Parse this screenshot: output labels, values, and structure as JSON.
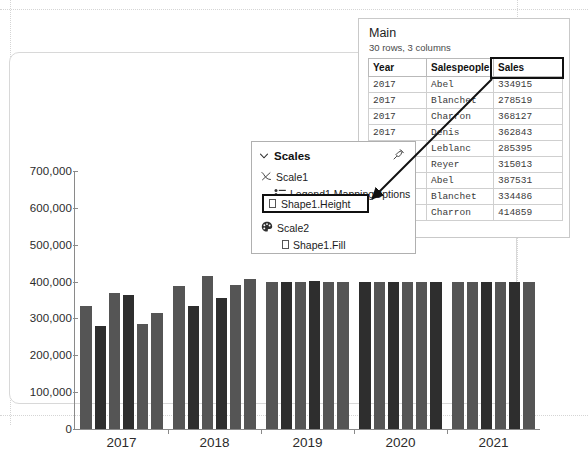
{
  "chart_data": {
    "type": "bar",
    "title": "",
    "xlabel": "",
    "ylabel": "",
    "ylim": [
      0,
      700000
    ],
    "grid": false,
    "legend": "none",
    "y_ticks": [
      "0",
      "100,000",
      "200,000",
      "300,000",
      "400,000",
      "500,000",
      "600,000",
      "700,000"
    ],
    "y_tick_values": [
      0,
      100000,
      200000,
      300000,
      400000,
      500000,
      600000,
      700000
    ],
    "categories": [
      "2017",
      "2018",
      "2019",
      "2020",
      "2021"
    ],
    "bar_color_light": "#555555",
    "bar_color_dark": "#2e2e2e",
    "bars": [
      {
        "year": "2017",
        "salespeople": "Abel",
        "value": 334915,
        "shade": "light"
      },
      {
        "year": "2017",
        "salespeople": "Blanchet",
        "value": 278519,
        "shade": "dark"
      },
      {
        "year": "2017",
        "salespeople": "Charron",
        "value": 368127,
        "shade": "light"
      },
      {
        "year": "2017",
        "salespeople": "Denis",
        "value": 362843,
        "shade": "dark"
      },
      {
        "year": "2017",
        "salespeople": "Leblanc",
        "value": 285395,
        "shade": "light"
      },
      {
        "year": "2017",
        "salespeople": "Reyer",
        "value": 315013,
        "shade": "light"
      },
      {
        "year": "2018",
        "salespeople": "Abel",
        "value": 387531,
        "shade": "light"
      },
      {
        "year": "2018",
        "salespeople": "Blanchet",
        "value": 334486,
        "shade": "dark"
      },
      {
        "year": "2018",
        "salespeople": "Charron",
        "value": 414859,
        "shade": "light"
      },
      {
        "year": "2018",
        "salespeople": "Denis",
        "value": 355000,
        "shade": "dark"
      },
      {
        "year": "2018",
        "salespeople": "Leblanc",
        "value": 390000,
        "shade": "light"
      },
      {
        "year": "2018",
        "salespeople": "Reyer",
        "value": 408000,
        "shade": "light"
      },
      {
        "year": "2019",
        "salespeople": "Abel",
        "value": 400000,
        "shade": "light"
      },
      {
        "year": "2019",
        "salespeople": "Blanchet",
        "value": 398000,
        "shade": "dark"
      },
      {
        "year": "2019",
        "salespeople": "Charron",
        "value": 400000,
        "shade": "light"
      },
      {
        "year": "2019",
        "salespeople": "Denis",
        "value": 402000,
        "shade": "dark"
      },
      {
        "year": "2019",
        "salespeople": "Leblanc",
        "value": 400000,
        "shade": "light"
      },
      {
        "year": "2019",
        "salespeople": "Reyer",
        "value": 400000,
        "shade": "light"
      },
      {
        "year": "2020",
        "salespeople": "Abel",
        "value": 400000,
        "shade": "dark"
      },
      {
        "year": "2020",
        "salespeople": "Blanchet",
        "value": 400000,
        "shade": "light"
      },
      {
        "year": "2020",
        "salespeople": "Charron",
        "value": 400000,
        "shade": "dark"
      },
      {
        "year": "2020",
        "salespeople": "Denis",
        "value": 400000,
        "shade": "light"
      },
      {
        "year": "2020",
        "salespeople": "Leblanc",
        "value": 400000,
        "shade": "light"
      },
      {
        "year": "2020",
        "salespeople": "Reyer",
        "value": 400000,
        "shade": "dark"
      },
      {
        "year": "2021",
        "salespeople": "Abel",
        "value": 400000,
        "shade": "light"
      },
      {
        "year": "2021",
        "salespeople": "Blanchet",
        "value": 400000,
        "shade": "light"
      },
      {
        "year": "2021",
        "salespeople": "Charron",
        "value": 400000,
        "shade": "dark"
      },
      {
        "year": "2021",
        "salespeople": "Denis",
        "value": 400000,
        "shade": "light"
      },
      {
        "year": "2021",
        "salespeople": "Leblanc",
        "value": 400000,
        "shade": "dark"
      },
      {
        "year": "2021",
        "salespeople": "Reyer",
        "value": 400000,
        "shade": "light"
      }
    ]
  },
  "table": {
    "title": "Main",
    "subtitle": "30 rows, 3 columns",
    "columns": [
      "Year",
      "Salespeople",
      "Sales"
    ],
    "highlighted_column": "Sales",
    "rows": [
      [
        "2017",
        "Abel",
        "334915"
      ],
      [
        "2017",
        "Blanchet",
        "278519"
      ],
      [
        "2017",
        "Charron",
        "368127"
      ],
      [
        "2017",
        "Denis",
        "362843"
      ],
      [
        "",
        "Leblanc",
        "285395"
      ],
      [
        "",
        "Reyer",
        "315013"
      ],
      [
        "",
        "Abel",
        "387531"
      ],
      [
        "",
        "Blanchet",
        "334486"
      ],
      [
        "",
        "Charron",
        "414859"
      ]
    ]
  },
  "scales_panel": {
    "title": "Scales",
    "collapse_icon": "chevron-down-icon",
    "pin_icon": "pin-icon",
    "tree": [
      {
        "label": "Scale1",
        "icon": "curve-icon",
        "level": 1
      },
      {
        "label": "Legend1.MappingOptions",
        "icon": "legend-icon",
        "level": 2
      },
      {
        "label": "Shape1.Height",
        "icon": "square-icon",
        "level": 3,
        "highlighted": true
      },
      {
        "label": "Scale2",
        "icon": "palette-icon",
        "level": 1
      },
      {
        "label": "Shape1.Fill",
        "icon": "square-icon",
        "level": 3
      }
    ]
  },
  "annotation": {
    "arrow": "sales-column-to-shape1-height",
    "highlight_color": "#101010"
  }
}
